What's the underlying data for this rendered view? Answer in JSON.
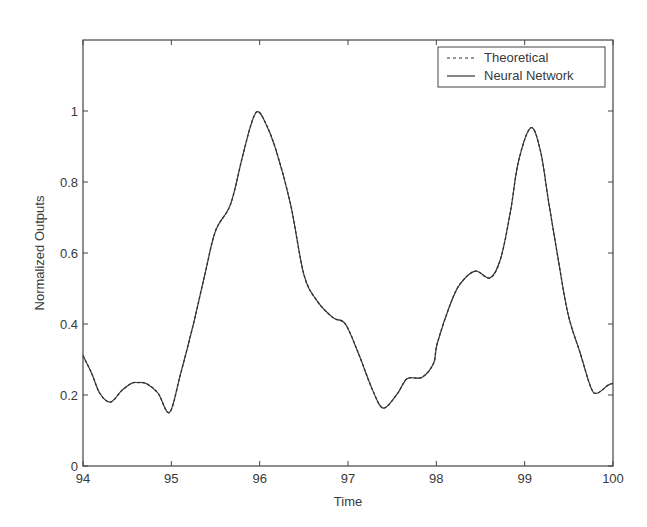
{
  "chart_data": {
    "type": "line",
    "title": "",
    "xlabel": "Time",
    "ylabel": "Normalized Outputs",
    "xlim": [
      94,
      100
    ],
    "ylim": [
      0,
      1.2
    ],
    "xticks": [
      94,
      95,
      96,
      97,
      98,
      99,
      100
    ],
    "xtick_labels": [
      "94",
      "95",
      "96",
      "97",
      "98",
      "99",
      "100"
    ],
    "yticks": [
      0,
      0.2,
      0.4,
      0.6,
      0.8,
      1.0
    ],
    "ytick_labels": [
      "0",
      "0.2",
      "0.4",
      "0.6",
      "0.8",
      "1"
    ],
    "grid": false,
    "legend_position": "top-right",
    "series": [
      {
        "name": "Theoretical",
        "style": "dashed",
        "color": "#333333",
        "x": [
          94.0,
          94.1,
          94.19,
          94.31,
          94.44,
          94.55,
          94.62,
          94.72,
          94.85,
          94.98,
          95.1,
          95.25,
          95.38,
          95.5,
          95.67,
          95.8,
          95.9,
          95.97,
          96.05,
          96.18,
          96.35,
          96.5,
          96.65,
          96.83,
          96.97,
          97.12,
          97.28,
          97.4,
          97.56,
          97.67,
          97.84,
          97.97,
          98.01,
          98.16,
          98.27,
          98.44,
          98.61,
          98.73,
          98.84,
          98.93,
          99.07,
          99.18,
          99.27,
          99.37,
          99.49,
          99.63,
          99.75,
          99.82,
          99.94,
          100.0
        ],
        "y": [
          0.311,
          0.26,
          0.205,
          0.18,
          0.213,
          0.233,
          0.235,
          0.232,
          0.205,
          0.151,
          0.255,
          0.4,
          0.54,
          0.662,
          0.737,
          0.866,
          0.96,
          0.998,
          0.975,
          0.894,
          0.737,
          0.54,
          0.465,
          0.418,
          0.4,
          0.316,
          0.213,
          0.163,
          0.204,
          0.246,
          0.25,
          0.29,
          0.345,
          0.457,
          0.513,
          0.549,
          0.53,
          0.586,
          0.718,
          0.858,
          0.953,
          0.886,
          0.746,
          0.597,
          0.429,
          0.317,
          0.221,
          0.205,
          0.227,
          0.233
        ]
      },
      {
        "name": "Neural Network",
        "style": "solid",
        "color": "#333333",
        "x": [
          94.0,
          94.1,
          94.19,
          94.31,
          94.44,
          94.55,
          94.62,
          94.72,
          94.85,
          94.98,
          95.1,
          95.25,
          95.38,
          95.5,
          95.67,
          95.8,
          95.9,
          95.97,
          96.05,
          96.18,
          96.35,
          96.5,
          96.65,
          96.83,
          96.97,
          97.12,
          97.28,
          97.4,
          97.56,
          97.67,
          97.84,
          97.97,
          98.01,
          98.16,
          98.27,
          98.44,
          98.61,
          98.73,
          98.84,
          98.93,
          99.07,
          99.18,
          99.27,
          99.37,
          99.49,
          99.63,
          99.75,
          99.82,
          99.94,
          100.0
        ],
        "y": [
          0.311,
          0.26,
          0.205,
          0.18,
          0.213,
          0.233,
          0.235,
          0.232,
          0.205,
          0.151,
          0.255,
          0.4,
          0.54,
          0.662,
          0.737,
          0.866,
          0.96,
          0.998,
          0.975,
          0.894,
          0.737,
          0.54,
          0.465,
          0.418,
          0.4,
          0.316,
          0.213,
          0.163,
          0.204,
          0.246,
          0.25,
          0.29,
          0.345,
          0.457,
          0.513,
          0.549,
          0.53,
          0.586,
          0.718,
          0.858,
          0.953,
          0.886,
          0.746,
          0.597,
          0.429,
          0.317,
          0.221,
          0.205,
          0.227,
          0.233
        ]
      }
    ]
  }
}
